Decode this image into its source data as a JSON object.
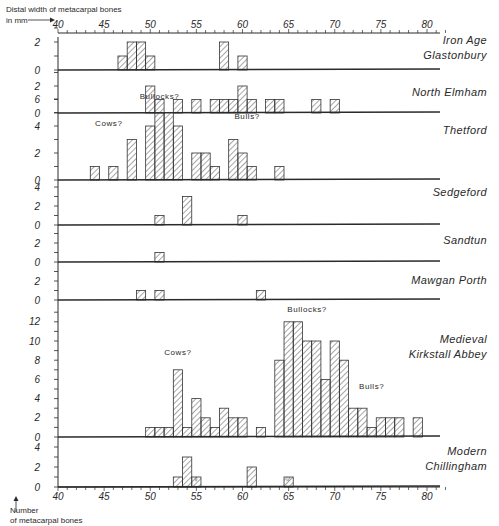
{
  "chart_data": {
    "type": "bar",
    "subtype": "stacked-panel histograms",
    "title": "",
    "xlabel": "Distal width of metacarpal bones in mm",
    "ylabel": "Number of metacarpal bones",
    "x_axis": {
      "min": 40,
      "max": 80,
      "ticks": [
        40,
        45,
        50,
        55,
        60,
        65,
        70,
        75,
        80
      ],
      "bin_width_mm": 1
    },
    "panels": [
      {
        "name": "Iron Age Glastonbury",
        "label_lines": [
          "Iron Age",
          "Glastonbury"
        ],
        "yticks": [
          0,
          2
        ],
        "ymax": 3,
        "bins": [
          [
            47,
            1
          ],
          [
            48,
            2
          ],
          [
            49,
            2
          ],
          [
            50,
            1
          ],
          [
            58,
            2
          ],
          [
            60,
            1
          ]
        ],
        "annotations": []
      },
      {
        "name": "North Elmham",
        "label_lines": [
          "North Elmham"
        ],
        "yticks": [
          0,
          2
        ],
        "ymax": 3,
        "bins": [
          [
            50,
            2
          ],
          [
            51,
            1
          ],
          [
            53,
            1
          ],
          [
            55,
            1
          ],
          [
            57,
            1
          ],
          [
            58,
            1
          ],
          [
            59,
            1
          ],
          [
            60,
            2
          ],
          [
            61,
            1
          ],
          [
            63,
            1
          ],
          [
            64,
            1
          ],
          [
            68,
            1
          ],
          [
            70,
            1
          ]
        ],
        "annotations": []
      },
      {
        "name": "Thetford",
        "label_lines": [
          "Thetford"
        ],
        "yticks": [
          0,
          2,
          4,
          6
        ],
        "ymax": 6,
        "bins": [
          [
            44,
            1
          ],
          [
            46,
            1
          ],
          [
            48,
            3
          ],
          [
            50,
            4
          ],
          [
            51,
            5
          ],
          [
            52,
            5
          ],
          [
            53,
            4
          ],
          [
            55,
            2
          ],
          [
            56,
            2
          ],
          [
            57,
            1
          ],
          [
            59,
            3
          ],
          [
            60,
            2
          ],
          [
            61,
            1
          ],
          [
            64,
            1
          ]
        ],
        "annotations": [
          {
            "text": "Cows?",
            "x": 45.5,
            "y": 4
          },
          {
            "text": "Bullocks?",
            "x": 51,
            "y": 6
          },
          {
            "text": "Bulls?",
            "x": 60.5,
            "y": 4.5
          }
        ]
      },
      {
        "name": "Sedgeford",
        "label_lines": [
          "Sedgeford"
        ],
        "yticks": [
          0,
          2,
          4
        ],
        "ymax": 4,
        "bins": [
          [
            51,
            1
          ],
          [
            54,
            3
          ],
          [
            60,
            1
          ]
        ],
        "annotations": []
      },
      {
        "name": "Sandtun",
        "label_lines": [
          "Sandtun"
        ],
        "yticks": [
          0,
          2
        ],
        "ymax": 3,
        "bins": [
          [
            51,
            1
          ]
        ],
        "annotations": []
      },
      {
        "name": "Mawgan Porth",
        "label_lines": [
          "Mawgan Porth"
        ],
        "yticks": [
          0,
          2
        ],
        "ymax": 3,
        "bins": [
          [
            49,
            1
          ],
          [
            51,
            1
          ],
          [
            62,
            1
          ]
        ],
        "annotations": []
      },
      {
        "name": "Medieval Kirkstall Abbey",
        "label_lines": [
          "Medieval",
          "Kirkstall Abbey"
        ],
        "yticks": [
          0,
          2,
          4,
          6,
          8,
          10,
          12
        ],
        "ymax": 13,
        "bins": [
          [
            50,
            1
          ],
          [
            51,
            1
          ],
          [
            52,
            1
          ],
          [
            53,
            7
          ],
          [
            54,
            1
          ],
          [
            55,
            4
          ],
          [
            56,
            2
          ],
          [
            57,
            1
          ],
          [
            58,
            3
          ],
          [
            59,
            2
          ],
          [
            60,
            2
          ],
          [
            62,
            1
          ],
          [
            64,
            8
          ],
          [
            65,
            12
          ],
          [
            66,
            12
          ],
          [
            67,
            10
          ],
          [
            68,
            10
          ],
          [
            69,
            6
          ],
          [
            70,
            10
          ],
          [
            71,
            8
          ],
          [
            72,
            3
          ],
          [
            73,
            3
          ],
          [
            74,
            1
          ],
          [
            75,
            2
          ],
          [
            76,
            2
          ],
          [
            77,
            2
          ],
          [
            79,
            2
          ]
        ],
        "annotations": [
          {
            "text": "Cows?",
            "x": 53,
            "y": 8.5
          },
          {
            "text": "Bullocks?",
            "x": 67,
            "y": 13
          },
          {
            "text": "Bulls?",
            "x": 74,
            "y": 5
          }
        ]
      },
      {
        "name": "Modern Chillingham",
        "label_lines": [
          "Modern",
          "Chillingham"
        ],
        "yticks": [
          0,
          2,
          4
        ],
        "ymax": 4,
        "bins": [
          [
            53,
            1
          ],
          [
            54,
            3
          ],
          [
            55,
            1
          ],
          [
            61,
            2
          ],
          [
            65,
            1
          ]
        ],
        "annotations": [
          {
            "text": "♀",
            "x": 55,
            "y": 0.5
          },
          {
            "text": "♂",
            "x": 65,
            "y": 0.5
          }
        ]
      }
    ],
    "grid": false,
    "legend": null
  },
  "labels": {
    "xaxis_title_line1": "Distal width of metacarpal bones",
    "xaxis_title_line2": "in mm",
    "yaxis_title_line1": "Number",
    "yaxis_title_line2": "of metacarpal bones"
  }
}
